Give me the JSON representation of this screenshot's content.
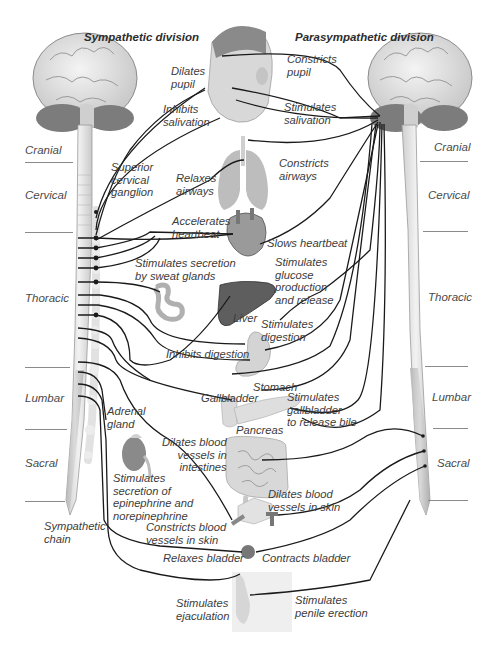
{
  "diagram": {
    "title_left": "Sympathetic division",
    "title_right": "Parasympathetic division",
    "regions_left": [
      "Cranial",
      "Cervical",
      "Thoracic",
      "Lumbar",
      "Sacral"
    ],
    "regions_right": [
      "Cranial",
      "Cervical",
      "Thoracic",
      "Lumbar",
      "Sacral"
    ],
    "structures": {
      "superior_cervical_ganglion": "Superior cervical ganglion",
      "sympathetic_chain": "Sympathetic chain",
      "adrenal_gland": "Adrenal gland",
      "liver": "Liver",
      "stomach": "Stomach",
      "gallbladder": "Gallbladder",
      "pancreas": "Pancreas"
    },
    "sympathetic_effects": [
      "Dilates pupil",
      "Inhibits salivation",
      "Relaxes airways",
      "Accelerates heartbeat",
      "Stimulates secretion by sweat glands",
      "Stimulates glucose production and release",
      "Inhibits digestion",
      "Stimulates secretion of epinephrine and norepinephrine",
      "Dilates blood vessels in intestines",
      "Constricts blood vessels in skin",
      "Relaxes bladder",
      "Stimulates ejaculation"
    ],
    "parasympathetic_effects": [
      "Constricts pupil",
      "Stimulates salivation",
      "Constricts airways",
      "Slows heartbeat",
      "Stimulates digestion",
      "Stimulates gallbladder to release bile",
      "Dilates blood vessels in skin",
      "Contracts bladder",
      "Stimulates penile erection"
    ],
    "labels": {
      "dilates_pupil": [
        "Dilates",
        "pupil"
      ],
      "inhibits_salivation": [
        "Inhibits",
        "salivation"
      ],
      "constricts_pupil": [
        "Constricts",
        "pupil"
      ],
      "stimulates_salivation": [
        "Stimulates",
        "salivation"
      ],
      "superior_cervical_ganglion": [
        "Superior",
        "cervical",
        "ganglion"
      ],
      "relaxes_airways": [
        "Relaxes",
        "airways"
      ],
      "constricts_airways": [
        "Constricts",
        "airways"
      ],
      "accelerates_heartbeat": [
        "Accelerates",
        "heartbeat"
      ],
      "slows_heartbeat": "Slows heartbeat",
      "sweat": [
        "Stimulates secretion",
        "by sweat glands"
      ],
      "glucose": [
        "Stimulates",
        "glucose",
        "production",
        "and release"
      ],
      "liver": "Liver",
      "stim_digestion": [
        "Stimulates",
        "digestion"
      ],
      "inhibits_digestion": "Inhibits digestion",
      "stomach": "Stomach",
      "gallbladder": "Gallbladder",
      "bile": [
        "Stimulates",
        "gallbladder",
        "to release bile"
      ],
      "pancreas": "Pancreas",
      "adrenal": [
        "Adrenal",
        "gland"
      ],
      "epinephrine": [
        "Stimulates",
        "secretion of",
        "epinephrine and",
        "norepinephrine"
      ],
      "dilates_intestines": [
        "Dilates blood",
        "vessels in",
        "intestines"
      ],
      "dilates_skin": [
        "Dilates blood",
        "vessels in skin"
      ],
      "sympathetic_chain": [
        "Sympathetic",
        "chain"
      ],
      "constricts_skin": [
        "Constricts blood",
        "vessels in skin"
      ],
      "relaxes_bladder": "Relaxes bladder",
      "contracts_bladder": "Contracts bladder",
      "ejaculation": [
        "Stimulates",
        "ejaculation"
      ],
      "erection": [
        "Stimulates",
        "penile erection"
      ]
    },
    "colors": {
      "nerve": "#1a1a1a",
      "spinal_cord": "#e4e4e4",
      "brain": "#dcdcdc",
      "cerebellum": "#7a7a7a",
      "liver": "#5a5a5a",
      "organ": "#cfcfcf",
      "rule": "#8a8a8a"
    }
  }
}
